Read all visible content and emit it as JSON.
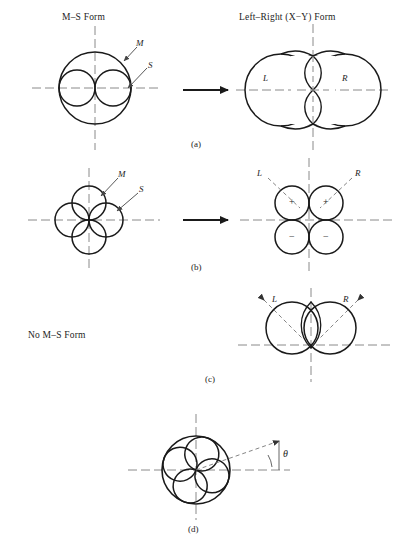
{
  "figure": {
    "headers": {
      "left": "M–S Form",
      "right": "Left–Right (X−Y) Form"
    },
    "no_ms_form_label": "No M–S Form",
    "subfigure_labels": {
      "a": "(a)",
      "b": "(b)",
      "c": "(c)",
      "d": "(d)"
    },
    "annotations": {
      "m": "M",
      "s": "S",
      "l": "L",
      "r": "R",
      "plus": "+",
      "minus": "−",
      "theta": "θ"
    },
    "colors": {
      "stroke": "#1a1a1a",
      "axis": "#777777",
      "leader": "#555555",
      "background": "#ffffff"
    },
    "rows": [
      {
        "id": "a",
        "left_pattern": "cardioid-M-with-two-S-lobes",
        "right_pattern": "two-overlapping-cardioids-L-R",
        "arrow": "transform-arrow"
      },
      {
        "id": "b",
        "left_pattern": "four-lobe-clover-M-S",
        "right_pattern": "four-quadrant-lobes-plus-minus",
        "arrow": "transform-arrow"
      },
      {
        "id": "c",
        "left_pattern": "none",
        "right_pattern": "two-upper-lobes-L-R-arrows",
        "arrow": "none"
      },
      {
        "id": "d",
        "left_pattern": "none",
        "right_pattern": "rotated-clover-in-circle-theta",
        "arrow": "none"
      }
    ]
  }
}
